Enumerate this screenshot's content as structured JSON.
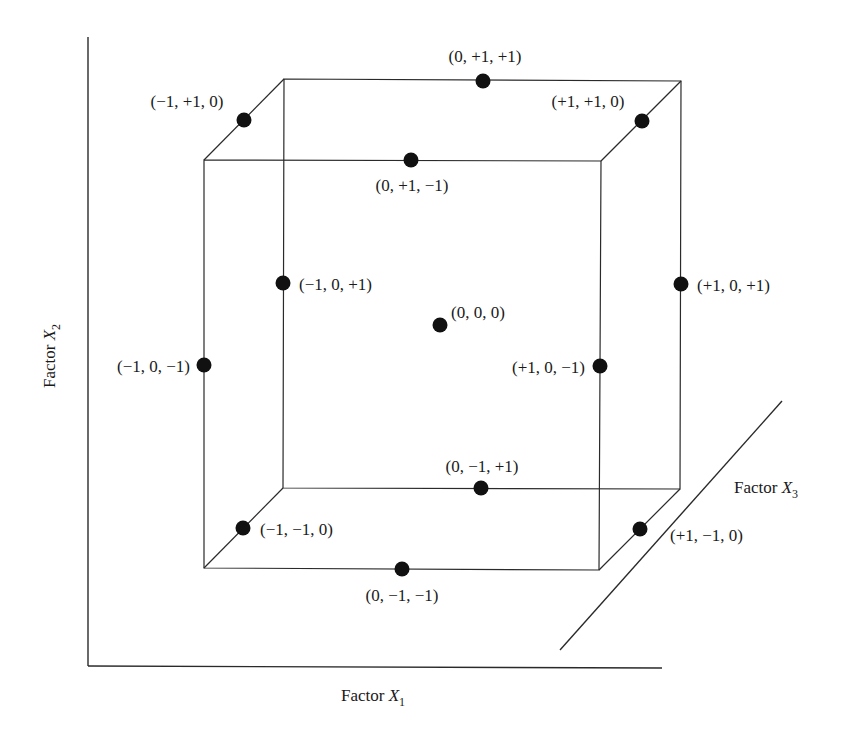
{
  "diagram": {
    "type": "box-behnken-design-cube",
    "axes": {
      "x1": {
        "label": "Factor ",
        "var": "X",
        "sub": "1"
      },
      "x2": {
        "label": "Factor ",
        "var": "X",
        "sub": "2"
      },
      "x3": {
        "label": "Factor ",
        "var": "X",
        "sub": "3"
      }
    },
    "points": [
      {
        "coord": "(0, +1, +1)",
        "x": 483,
        "y": 81
      },
      {
        "coord": "(−1, +1, 0)",
        "x": 244,
        "y": 120
      },
      {
        "coord": "(+1, +1, 0)",
        "x": 642,
        "y": 121
      },
      {
        "coord": "(0, +1, −1)",
        "x": 411,
        "y": 160
      },
      {
        "coord": "(−1, 0, +1)",
        "x": 283,
        "y": 283
      },
      {
        "coord": "(+1, 0, +1)",
        "x": 681,
        "y": 284
      },
      {
        "coord": "(0, 0, 0)",
        "x": 440,
        "y": 325
      },
      {
        "coord": "(−1, 0, −1)",
        "x": 204,
        "y": 365
      },
      {
        "coord": "(+1, 0, −1)",
        "x": 600,
        "y": 366
      },
      {
        "coord": "(0, −1, +1)",
        "x": 481,
        "y": 488
      },
      {
        "coord": "(−1, −1, 0)",
        "x": 243,
        "y": 528
      },
      {
        "coord": "(+1, −1, 0)",
        "x": 640,
        "y": 529
      },
      {
        "coord": "(0, −1, −1)",
        "x": 402,
        "y": 569
      }
    ]
  },
  "labels": {
    "p_0_p1_p1": "(0, +1, +1)",
    "p_m1_p1_0": "(−1, +1, 0)",
    "p_p1_p1_0": "(+1, +1, 0)",
    "p_0_p1_m1": "(0, +1, −1)",
    "p_m1_0_p1": "(−1, 0, +1)",
    "p_p1_0_p1": "(+1, 0, +1)",
    "p_0_0_0": "(0, 0, 0)",
    "p_m1_0_m1": "(−1, 0, −1)",
    "p_p1_0_m1": "(+1, 0, −1)",
    "p_0_m1_p1": "(0, −1, +1)",
    "p_m1_m1_0": "(−1, −1, 0)",
    "p_p1_m1_0": "(+1, −1, 0)",
    "p_0_m1_m1": "(0, −1, −1)"
  }
}
